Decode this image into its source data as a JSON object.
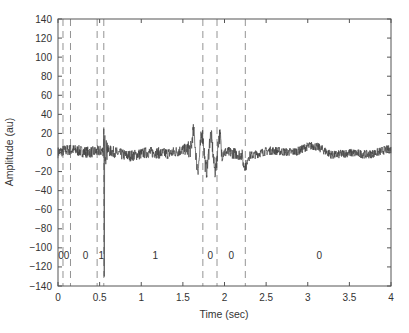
{
  "chart_data": {
    "type": "line",
    "title": "",
    "xlabel": "Time (sec)",
    "ylabel": "Amplitude (au)",
    "xlim": [
      0,
      4
    ],
    "ylim": [
      -140,
      140
    ],
    "xticks": [
      0,
      0.5,
      1,
      1.5,
      2,
      2.5,
      3,
      3.5,
      4
    ],
    "xtick_labels": [
      "0",
      "0.5",
      "1",
      "1.5",
      "2",
      "2.5",
      "3",
      "3.5",
      "4"
    ],
    "yticks": [
      140,
      120,
      100,
      80,
      60,
      40,
      20,
      0,
      -20,
      -40,
      -60,
      -80,
      -100,
      -120,
      -140
    ],
    "ytick_labels": [
      "140",
      "120",
      "100",
      "80",
      "60",
      "40",
      "20",
      "0",
      "−20",
      "−40",
      "−60",
      "−80",
      "−100",
      "−120",
      "−140"
    ],
    "grid": false,
    "legend": null,
    "series": [
      {
        "name": "signal",
        "description": "noisy waveform centered near 0 with baseline noise about ±8; sharp spike at ~0.55 s reaching about +25 and down to about -130; burst of oscillation between ~1.6 and ~1.95 s with peaks about +22 and troughs about -30; small dip near 2.25 s; quieter noise from 2.3 to 4 s with a slight rise near 3.1 s",
        "key_points": [
          {
            "x": 0.0,
            "y": 0
          },
          {
            "x": 0.5,
            "y": 3
          },
          {
            "x": 0.55,
            "y": 25
          },
          {
            "x": 0.56,
            "y": -130
          },
          {
            "x": 0.6,
            "y": -5
          },
          {
            "x": 1.0,
            "y": 5
          },
          {
            "x": 1.6,
            "y": 15
          },
          {
            "x": 1.75,
            "y": 22
          },
          {
            "x": 1.8,
            "y": -25
          },
          {
            "x": 1.87,
            "y": 20
          },
          {
            "x": 1.92,
            "y": -30
          },
          {
            "x": 2.0,
            "y": 5
          },
          {
            "x": 2.25,
            "y": -15
          },
          {
            "x": 3.1,
            "y": 8
          },
          {
            "x": 4.0,
            "y": 0
          }
        ],
        "color": "#444444"
      }
    ],
    "segment_boundaries": [
      0.06,
      0.15,
      0.47,
      0.55,
      1.74,
      1.91,
      2.25
    ],
    "segment_labels": [
      {
        "text": "00",
        "x": 0.07
      },
      {
        "text": "0",
        "x": 0.33
      },
      {
        "text": "1",
        "x": 0.52
      },
      {
        "text": "1",
        "x": 1.17
      },
      {
        "text": "0",
        "x": 1.83
      },
      {
        "text": "0",
        "x": 2.08
      },
      {
        "text": "0",
        "x": 3.14
      }
    ],
    "segment_label_y": -108,
    "colors": {
      "axis": "#555555",
      "signal": "#444444",
      "dashed": "#888888"
    }
  }
}
